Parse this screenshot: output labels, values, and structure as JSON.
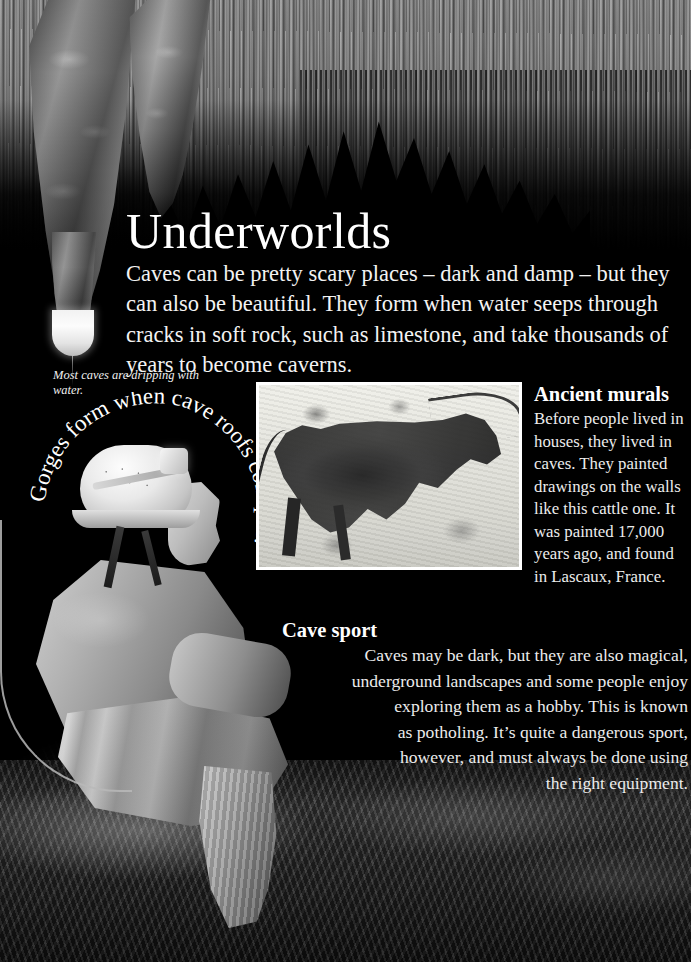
{
  "page": {
    "title": "Underworlds",
    "intro": "Caves can be pretty scary places – dark and damp – but they can also be beautiful. They form when water seeps through cracks in soft rock, such as limestone, and take thousands of years to become caverns.",
    "drip_caption": "Most caves are dripping with water.",
    "curved_caption": "Gorges form when cave roofs collapse.",
    "background_color": "#000000",
    "text_color": "#ffffff"
  },
  "mural_photo": {
    "alt": "Lascaux cave painting of a bull",
    "border_color": "#ffffff"
  },
  "sections": [
    {
      "id": "ancient-murals",
      "heading": "Ancient murals",
      "body": "Before people lived in houses, they lived in caves. They painted drawings on the walls like this cattle one. It was painted 17,000 years ago, and found in Lascaux, France."
    },
    {
      "id": "cave-sport",
      "heading": "Cave sport",
      "lines": [
        "Caves may be dark, but they are also magical,",
        "underground landscapes and some people enjoy",
        "exploring them as a hobby. This is known",
        "as potholing. It’s quite a dangerous sport,",
        "however, and must always be done using",
        "the right equipment."
      ]
    }
  ],
  "photos": {
    "ceiling_alt": "cave ceiling covered in stalactites",
    "caver_alt": "caver wearing white helmet with headlamp seated on a rock",
    "ground_alt": "dark cave floor rocks"
  }
}
